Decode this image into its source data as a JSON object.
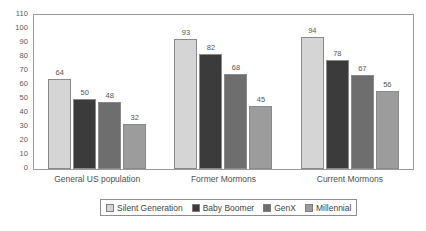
{
  "chart_data": {
    "type": "bar",
    "title": "",
    "subtitle": "",
    "xlabel": "",
    "ylabel": "",
    "ylim": [
      0,
      110
    ],
    "yticks": [
      0,
      10,
      20,
      30,
      40,
      50,
      60,
      70,
      80,
      90,
      100,
      110
    ],
    "ytick_labels": [
      "0",
      "10",
      "20",
      "30",
      "40",
      "50",
      "60",
      "70",
      "80",
      "90",
      "100",
      "110"
    ],
    "grid": false,
    "legend_position": "bottom-center",
    "categories": [
      "General US population",
      "Former Mormons",
      "Current Mormons"
    ],
    "series": [
      {
        "name": "Silent Generation",
        "color": "#d5d5d5",
        "values": [
          64,
          93,
          94
        ]
      },
      {
        "name": "Baby Boomer",
        "color": "#3b3b3b",
        "values": [
          50,
          82,
          78
        ]
      },
      {
        "name": "GenX",
        "color": "#6e6e6e",
        "values": [
          48,
          68,
          67
        ]
      },
      {
        "name": "Millennial",
        "color": "#9c9c9c",
        "values": [
          32,
          45,
          56
        ]
      }
    ],
    "data_labels": [
      [
        "64",
        "50",
        "48",
        "32"
      ],
      [
        "93",
        "82",
        "68",
        "45"
      ],
      [
        "94",
        "78",
        "67",
        "56"
      ]
    ],
    "colors": {
      "plot_border": "#9b9b9b",
      "bar_border": "#8a8a8a",
      "legend_border": "#8d8d8d",
      "text": "#4a4a4a",
      "background": "#ffffff"
    }
  }
}
